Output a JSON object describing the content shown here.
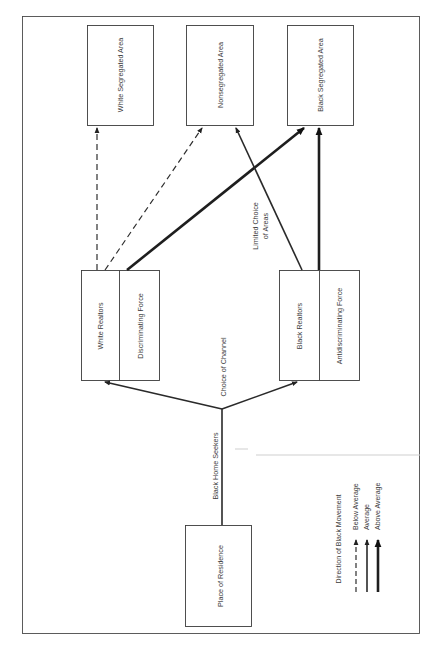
{
  "diagram": {
    "type": "flow-diagram",
    "nodes": {
      "white_segregated_area": "White Segregated Area",
      "nonsegregated_area": "Nonsegregated Area",
      "black_segregated_area": "Black Segregated Area",
      "white_realtors": "White Realtors",
      "discriminating_force": "Discriminating Force",
      "black_realtors": "Black Realtors",
      "antidiscriminating_force": "Antidiscriminating Force",
      "place_of_residence": "Place of Residence"
    },
    "edge_labels": {
      "black_home_seekers": "Black Home Seekers",
      "choice_of_channel": "Choice of Channel",
      "limited_choice_line1": "Limited Choice",
      "limited_choice_line2": "of Areas"
    },
    "edges": [
      {
        "from": "Place of Residence",
        "to": "Choice of Channel",
        "style": "average",
        "label": "Black Home Seekers"
      },
      {
        "from": "Choice of Channel",
        "to": "White Realtors",
        "style": "average"
      },
      {
        "from": "Choice of Channel",
        "to": "Black Realtors",
        "style": "average"
      },
      {
        "from": "White Realtors",
        "to": "White Segregated Area",
        "style": "below-average"
      },
      {
        "from": "White Realtors",
        "to": "Nonsegregated Area",
        "style": "below-average"
      },
      {
        "from": "Discriminating Force",
        "to": "Black Segregated Area",
        "style": "above-average"
      },
      {
        "from": "Black Realtors",
        "to": "Nonsegregated Area",
        "style": "average",
        "label": "Limited Choice of Areas"
      },
      {
        "from": "Antidiscriminating Force",
        "to": "Black Segregated Area",
        "style": "above-average"
      }
    ],
    "legend": {
      "title": "Direction of Black Movement",
      "items": [
        {
          "style": "dashed",
          "label": "Below Average"
        },
        {
          "style": "thin",
          "label": "Average"
        },
        {
          "style": "thick",
          "label": "Above Average"
        }
      ]
    }
  }
}
